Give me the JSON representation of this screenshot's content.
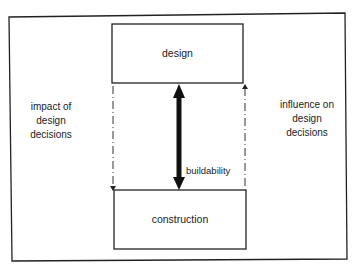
{
  "diagram": {
    "boxes": {
      "design": {
        "label": "design"
      },
      "construction": {
        "label": "construction"
      }
    },
    "left_annotation": {
      "lines": [
        "impact of",
        "design",
        "decisions"
      ]
    },
    "right_annotation": {
      "lines": [
        "influence on",
        "design",
        "decisions"
      ]
    },
    "center_arrow": {
      "label": "buildability",
      "style": "thick double-headed"
    },
    "left_arrow": {
      "style": "dash-dot",
      "direction": "down"
    },
    "right_arrow": {
      "style": "dash-dot",
      "direction": "up"
    }
  }
}
